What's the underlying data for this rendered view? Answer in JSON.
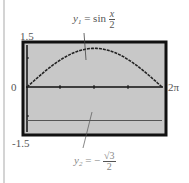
{
  "chart_data": {
    "type": "line",
    "title": "",
    "xlabel": "",
    "ylabel": "",
    "xlim": [
      0,
      "2π"
    ],
    "ylim": [
      -1.5,
      1.5
    ],
    "x_tick_labels": {
      "left": "0",
      "right": "2π"
    },
    "y_tick_labels": {
      "top": "1.5",
      "bottom": "-1.5"
    },
    "grid": false,
    "legend": null,
    "series": [
      {
        "name": "y1 = sin(x/2)",
        "label_main": "y",
        "label_sub": "1",
        "label_rhs": "= sin",
        "frac_num": "x",
        "frac_den": "2",
        "x": [
          0,
          0.785,
          1.571,
          2.356,
          3.142,
          3.927,
          4.712,
          5.498,
          6.283
        ],
        "values": [
          0,
          0.383,
          0.707,
          0.924,
          1.0,
          0.924,
          0.707,
          0.383,
          0
        ]
      },
      {
        "name": "y2 = -√3/2",
        "label_main": "y",
        "label_sub": "2",
        "label_rhs": "= −",
        "frac_num": "√3",
        "frac_den": "2",
        "x": [
          0,
          6.283
        ],
        "values": [
          -0.866,
          -0.866
        ]
      }
    ],
    "background_color": "#c8c8c8",
    "frame_color": "#111111"
  }
}
